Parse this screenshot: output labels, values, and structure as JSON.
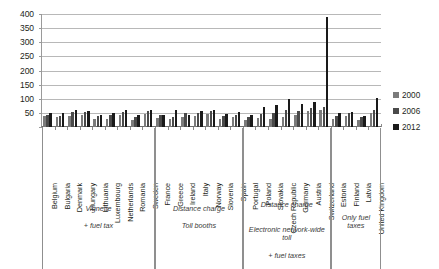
{
  "chart_data": {
    "type": "bar",
    "title": "",
    "subtitle": "",
    "xlabel": "",
    "ylabel": "",
    "ylim": [
      0,
      400
    ],
    "yticks": [
      0,
      50,
      100,
      150,
      200,
      250,
      300,
      350,
      400
    ],
    "ytick_labels": [
      "",
      "50",
      "100",
      "150",
      "200",
      "250",
      "300",
      "350",
      "400"
    ],
    "grid": true,
    "legend_position": "right",
    "categories": [
      "Belgium",
      "Bulgaria",
      "Denmark",
      "Hungary",
      "Lithuania",
      "Luxembourg",
      "Netherlands",
      "Romania",
      "Sweden",
      "France",
      "Greece",
      "Ireland",
      "Italy",
      "Norway",
      "Slovenia",
      "Spain",
      "Portugal",
      "Poland",
      "Slovakia",
      "Czech Republic",
      "Germany",
      "Austria",
      "Switzerland",
      "Estonia",
      "Finland",
      "Latvia",
      "United Kingdom"
    ],
    "series": [
      {
        "name": "2000",
        "color": "#7b7b7b",
        "values": [
          38,
          34,
          40,
          42,
          28,
          30,
          42,
          24,
          45,
          32,
          28,
          36,
          40,
          45,
          30,
          34,
          25,
          33,
          30,
          36,
          42,
          55,
          60,
          30,
          40,
          26,
          48
        ]
      },
      {
        "name": "2006",
        "color": "#4a4a4a",
        "values": [
          44,
          40,
          52,
          54,
          38,
          42,
          54,
          34,
          58,
          44,
          36,
          48,
          50,
          58,
          40,
          44,
          36,
          46,
          50,
          62,
          58,
          66,
          72,
          38,
          48,
          34,
          62
        ]
      },
      {
        "name": "2012",
        "color": "#1a1a1a",
        "values": [
          50,
          48,
          62,
          58,
          44,
          50,
          60,
          42,
          62,
          44,
          62,
          44,
          56,
          60,
          46,
          52,
          44,
          70,
          78,
          98,
          82,
          88,
          390,
          50,
          54,
          40,
          104
        ]
      }
    ],
    "groups": [
      {
        "id": "vignette",
        "caption_primary": "Vignette",
        "caption_secondary": "+ fuel tax",
        "start_index": 0,
        "end_index": 8
      },
      {
        "id": "distance-charge-toll-booths",
        "caption_primary": "Distance charge",
        "caption_secondary": "Toll booths",
        "start_index": 9,
        "end_index": 15
      },
      {
        "id": "distance-charge-electronic-toll",
        "caption_primary": "Distance charge",
        "caption_secondary": "Electronic network-wide toll",
        "caption_tertiary": "+ fuel taxes",
        "start_index": 16,
        "end_index": 22
      },
      {
        "id": "only-fuel-taxes",
        "caption_primary": "",
        "caption_secondary": "Only fuel taxes",
        "start_index": 23,
        "end_index": 26
      }
    ]
  },
  "legend": {
    "items": [
      {
        "label": "2000",
        "color": "#7b7b7b"
      },
      {
        "label": "2006",
        "color": "#4a4a4a"
      },
      {
        "label": "2012",
        "color": "#1a1a1a"
      }
    ]
  }
}
